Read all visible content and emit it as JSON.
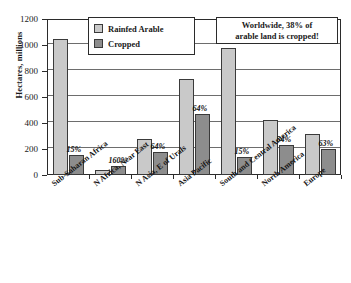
{
  "chart_data": {
    "type": "bar",
    "title": "",
    "xlabel": "",
    "ylabel": "Hectares, millions",
    "ylim": [
      0,
      1200
    ],
    "yticks": [
      0,
      200,
      400,
      600,
      800,
      1000,
      1200
    ],
    "ytick_labels": [
      "0",
      "200",
      "400",
      "600",
      "800",
      "1000",
      "1200"
    ],
    "grid": true,
    "legend_position": "top-left-inside",
    "categories": [
      "Sub-Saharan Africa",
      "N Africa, Near East",
      "N Asia, E of Urals",
      "Asia Pacific",
      "South and Central America",
      "North America",
      "Europe"
    ],
    "series": [
      {
        "name": "Rainfed Arable",
        "color": "#c9c9c9",
        "values": [
          1050,
          42,
          275,
          735,
          975,
          425,
          318
        ]
      },
      {
        "name": "Cropped",
        "color": "#8d8d8d",
        "values": [
          155,
          68,
          175,
          470,
          140,
          228,
          198
        ]
      }
    ],
    "data_labels": [
      "15%",
      "160%",
      "64%",
      "64%",
      "15%",
      "54%",
      "63%"
    ],
    "annotations": [
      {
        "line1": "Worldwide, 38% of",
        "line2": "arable land is cropped!"
      }
    ]
  },
  "axis": {
    "y_title": "Hectares, millions"
  },
  "legend": {
    "items": [
      {
        "label": "Rainfed Arable"
      },
      {
        "label": "Cropped"
      }
    ]
  }
}
